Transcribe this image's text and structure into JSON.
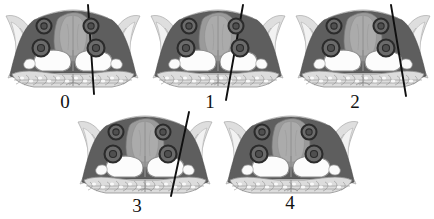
{
  "figure": {
    "type": "medical-imaging-panel-grid",
    "title": "",
    "caption": "",
    "panel_count": 5,
    "rows": 2,
    "columns_row1": 3,
    "columns_row2": 2,
    "background_color": "#ffffff"
  },
  "colors": {
    "background": "#ffffff",
    "sinus_dark": "#5e5e5e",
    "sinus_dark_edge": "#4a4a4a",
    "septum_mid": "#8f8f8f",
    "septum_light": "#a8a8a8",
    "bone_light": "#d8d8d8",
    "bone_outline": "#9a9a9a",
    "trabecular": "#b9b9b9",
    "marker_ring": "#2b2b2b",
    "marker_fill": "#6b6b6b",
    "marker_core": "#4f4f4f",
    "trajectory_line": "#101010",
    "label_text": "#111111",
    "air_cavity": "#fbfbfb"
  },
  "panels": [
    {
      "id": "panel-0",
      "label": "0",
      "label_x": 65,
      "label_y": 92,
      "x": 4,
      "y": 4,
      "width": 138,
      "height": 86,
      "has_trajectory_line": true,
      "line": {
        "x1": 88,
        "y1": 5,
        "x2": 94,
        "y2": 94,
        "angle_description": "near-vertical, slight rightward tilt"
      },
      "markers": [
        {
          "name": "marker-upper-left",
          "cx": 44,
          "cy": 26,
          "r": 7.5
        },
        {
          "name": "marker-upper-right",
          "cx": 91,
          "cy": 26,
          "r": 7.5
        },
        {
          "name": "marker-lower-left",
          "cx": 41,
          "cy": 48,
          "r": 8.5
        },
        {
          "name": "marker-lower-right",
          "cx": 96,
          "cy": 48,
          "r": 8.5
        }
      ]
    },
    {
      "id": "panel-1",
      "label": "1",
      "label_x": 210,
      "label_y": 92,
      "x": 149,
      "y": 4,
      "width": 138,
      "height": 86,
      "has_trajectory_line": true,
      "line": {
        "x1": 243,
        "y1": 5,
        "x2": 226,
        "y2": 100,
        "angle_description": "tilted, top-right to bottom-left"
      },
      "markers": [
        {
          "name": "marker-upper-left",
          "cx": 189,
          "cy": 26,
          "r": 7.5
        },
        {
          "name": "marker-upper-right",
          "cx": 236,
          "cy": 26,
          "r": 7.5
        },
        {
          "name": "marker-lower-left",
          "cx": 186,
          "cy": 48,
          "r": 8.5
        },
        {
          "name": "marker-lower-right",
          "cx": 240,
          "cy": 48,
          "r": 8.5
        }
      ]
    },
    {
      "id": "panel-2",
      "label": "2",
      "label_x": 355,
      "label_y": 92,
      "x": 294,
      "y": 4,
      "width": 138,
      "height": 86,
      "has_trajectory_line": true,
      "line": {
        "x1": 391,
        "y1": 5,
        "x2": 406,
        "y2": 96,
        "angle_description": "tilted, top-left to bottom-right"
      },
      "markers": [
        {
          "name": "marker-upper-left",
          "cx": 334,
          "cy": 26,
          "r": 7.5
        },
        {
          "name": "marker-upper-right",
          "cx": 381,
          "cy": 26,
          "r": 7.5
        },
        {
          "name": "marker-lower-left",
          "cx": 331,
          "cy": 48,
          "r": 8.5
        },
        {
          "name": "marker-lower-right",
          "cx": 386,
          "cy": 48,
          "r": 8.5
        }
      ]
    },
    {
      "id": "panel-3",
      "label": "3",
      "label_x": 137,
      "label_y": 196,
      "x": 76,
      "y": 110,
      "width": 138,
      "height": 86,
      "has_trajectory_line": true,
      "line": {
        "x1": 189,
        "y1": 112,
        "x2": 171,
        "y2": 196,
        "angle_description": "tilted, top-right to bottom-left"
      },
      "markers": [
        {
          "name": "marker-upper-left",
          "cx": 116,
          "cy": 132,
          "r": 7.5
        },
        {
          "name": "marker-upper-right",
          "cx": 163,
          "cy": 132,
          "r": 7.5
        },
        {
          "name": "marker-lower-left",
          "cx": 113,
          "cy": 154,
          "r": 8.5
        },
        {
          "name": "marker-lower-right",
          "cx": 168,
          "cy": 154,
          "r": 8.5
        }
      ]
    },
    {
      "id": "panel-4",
      "label": "4",
      "label_x": 290,
      "label_y": 193,
      "x": 222,
      "y": 110,
      "width": 138,
      "height": 86,
      "has_trajectory_line": false,
      "line": null,
      "markers": [
        {
          "name": "marker-upper-left",
          "cx": 262,
          "cy": 132,
          "r": 7.5
        },
        {
          "name": "marker-upper-right",
          "cx": 309,
          "cy": 132,
          "r": 7.5
        },
        {
          "name": "marker-lower-left",
          "cx": 259,
          "cy": 154,
          "r": 8.5
        },
        {
          "name": "marker-lower-right",
          "cx": 314,
          "cy": 154,
          "r": 8.5
        }
      ]
    }
  ]
}
